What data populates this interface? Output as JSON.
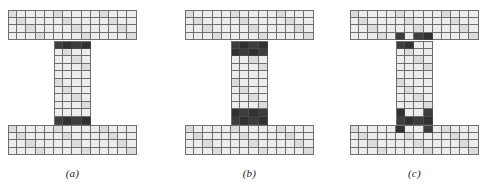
{
  "figure": {
    "background_color": "#ffffff",
    "line_color": "#6d6d6d",
    "cell_fill_color": "#ededed",
    "highlight_color": "#3a3a3a",
    "caption_color": "#1a1a1a",
    "panels": [
      {
        "id": "panel-a",
        "caption": "(a)",
        "x": 8,
        "geometry": {
          "cell_w": 9.2,
          "cell_h": 7.6,
          "flange_cols": 14,
          "flange_rows": 4,
          "web_cols": 4,
          "web_rows": 11,
          "web_col_offset": 5,
          "top_flange_y": 10,
          "web_y": 41,
          "bottom_flange_y": 125
        },
        "highlights": {
          "description": "single dark row at each web-flange junction, full web width",
          "web_top_rows": [
            0
          ],
          "web_bottom_rows": [
            10
          ],
          "web_top_cols": [
            0,
            1,
            2,
            3
          ],
          "web_bottom_cols": [
            0,
            1,
            2,
            3
          ],
          "flange_cells": []
        }
      },
      {
        "id": "panel-b",
        "caption": "(b)",
        "x": 185,
        "geometry": {
          "cell_w": 9.2,
          "cell_h": 7.6,
          "flange_cols": 14,
          "flange_rows": 4,
          "web_cols": 4,
          "web_rows": 11,
          "web_col_offset": 5,
          "top_flange_y": 10,
          "web_y": 41,
          "bottom_flange_y": 125
        },
        "highlights": {
          "description": "two dark rows at each web-flange junction, full web width",
          "web_top_rows": [
            0,
            1
          ],
          "web_bottom_rows": [
            9,
            10
          ],
          "web_top_cols": [
            0,
            1,
            2,
            3
          ],
          "web_bottom_cols": [
            0,
            1,
            2,
            3
          ],
          "flange_cells": []
        }
      },
      {
        "id": "panel-c",
        "caption": "(c)",
        "x": 350,
        "geometry": {
          "cell_w": 9.2,
          "cell_h": 7.6,
          "flange_cols": 14,
          "flange_rows": 4,
          "web_cols": 4,
          "web_rows": 11,
          "web_col_offset": 5,
          "top_flange_y": 10,
          "web_y": 41,
          "bottom_flange_y": 125
        },
        "highlights": {
          "description": "staggered dark cells in flange edge row and web end rows, outer web columns only",
          "web_top_rows": [
            0
          ],
          "web_bottom_rows": [
            10
          ],
          "web_top_cols": [
            0,
            1
          ],
          "web_bottom_cols": [
            0,
            1,
            2,
            3
          ],
          "flange_cells": [
            {
              "block": "top",
              "row": 3,
              "col": 5
            },
            {
              "block": "top",
              "row": 3,
              "col": 7
            },
            {
              "block": "top",
              "row": 3,
              "col": 8
            },
            {
              "block": "bottom",
              "row": 0,
              "col": 5
            },
            {
              "block": "bottom",
              "row": 0,
              "col": 8
            }
          ],
          "web_extra_cells": [
            {
              "row": 9,
              "col": 0
            },
            {
              "row": 9,
              "col": 3
            }
          ]
        }
      }
    ]
  }
}
